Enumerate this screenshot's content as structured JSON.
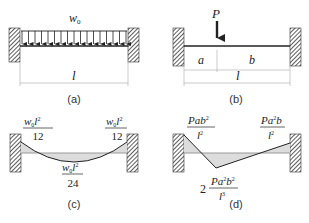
{
  "panels": {
    "a": {
      "caption": "(a)",
      "load_label": "w",
      "load_sub": "0",
      "span_label": "l"
    },
    "b": {
      "caption": "(b)",
      "load_label": "P",
      "seg_a": "a",
      "seg_b": "b",
      "span_label": "l"
    },
    "c": {
      "caption": "(c)",
      "left_moment": {
        "num_w": "w",
        "num_sub": "0",
        "num_l": "l",
        "num_exp": "2",
        "den": "12"
      },
      "right_moment": {
        "num_w": "w",
        "num_sub": "0",
        "num_l": "l",
        "num_exp": "2",
        "den": "12"
      },
      "mid_moment": {
        "num_w": "w",
        "num_sub": "0",
        "num_l": "l",
        "num_exp": "2",
        "den": "24"
      }
    },
    "d": {
      "caption": "(d)",
      "left_moment": {
        "num": "Pab",
        "num_exp": "2",
        "den": "l",
        "den_exp": "2"
      },
      "right_moment": {
        "num": "Pa",
        "num_exp": "2",
        "num_tail": "b",
        "den": "l",
        "den_exp": "2"
      },
      "mid_moment": {
        "coef": "2",
        "num": "Pa",
        "num_exp": "2",
        "num_mid": "b",
        "num_exp2": "2",
        "den": "l",
        "den_exp": "3"
      }
    }
  },
  "colors": {
    "line": "#222222",
    "hatch": "#333333",
    "fill": "#dcdcdc",
    "dim": "#aaaaaa"
  }
}
